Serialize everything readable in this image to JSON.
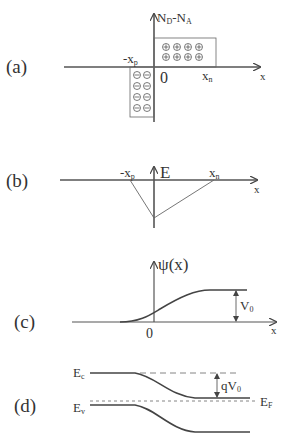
{
  "figure": {
    "panels": [
      {
        "id": "a",
        "label": "(a)",
        "y_axis": "N_D - N_A",
        "x_axis": "x",
        "ticks": {
          "left": "-x_p",
          "origin": "0",
          "right": "x_n"
        },
        "positive_charge_symbol": "⊕",
        "negative_charge_symbol": "⊖",
        "positive_rows": 2,
        "positive_cols": 4,
        "negative_rows": 4,
        "negative_cols": 2
      },
      {
        "id": "b",
        "label": "(b)",
        "y_axis": "E",
        "x_axis": "x",
        "ticks": {
          "left": "-x_p",
          "right": "x_n"
        }
      },
      {
        "id": "c",
        "label": "(c)",
        "y_axis": "ψ(x)",
        "x_axis": "x",
        "ticks": {
          "origin": "0"
        },
        "annotation": "V_0"
      },
      {
        "id": "d",
        "label": "(d)",
        "bands": {
          "conduction": "E_c",
          "valence": "E_v",
          "fermi": "E_F"
        },
        "annotation": "qV_0"
      }
    ]
  },
  "text": {
    "a_label": "(a)",
    "a_N": "N",
    "a_D": "D",
    "a_dash": "-",
    "a_NA": "N",
    "a_A": "A",
    "a_minus_x": "-x",
    "a_p": "p",
    "a_zero": "0",
    "a_xn": "x",
    "a_n": "n",
    "a_x": "x",
    "b_label": "(b)",
    "b_E": "E",
    "b_minus_x": "-x",
    "b_p": "p",
    "b_xn": "x",
    "b_n": "n",
    "b_x": "x",
    "c_label": "(c)",
    "c_psi": "ψ(x)",
    "c_V": "V",
    "c_0sub": "0",
    "c_zero": "0",
    "c_x": "x",
    "d_label": "(d)",
    "d_E": "E",
    "d_c": "c",
    "d_Ev": "E",
    "d_v": "v",
    "d_q": "qV",
    "d_0": "0",
    "d_EF": "E",
    "d_F": "F",
    "plus": "⊕",
    "minus": "⊖"
  }
}
